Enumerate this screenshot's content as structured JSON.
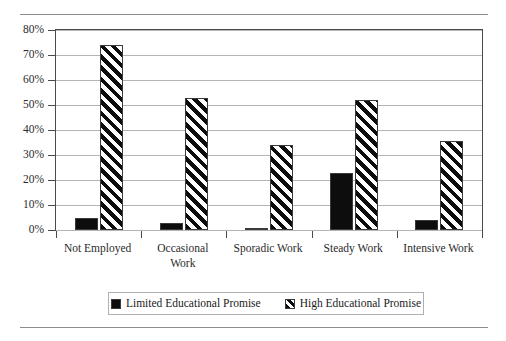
{
  "chart_data": {
    "type": "bar",
    "title": "",
    "subtitle": "",
    "xlabel": "",
    "ylabel": "",
    "ylim": [
      0,
      80
    ],
    "ytick_values": [
      0,
      10,
      20,
      30,
      40,
      50,
      60,
      70,
      80
    ],
    "ytick_labels": [
      "0%",
      "10%",
      "20%",
      "30%",
      "40%",
      "50%",
      "60%",
      "70%",
      "80%"
    ],
    "grid": true,
    "grid_axis": "y",
    "legend_position": "bottom",
    "categories": [
      "Not Employed",
      "Occasional Work",
      "Sporadic Work",
      "Steady Work",
      "Intensive Work"
    ],
    "category_label_lines": [
      [
        "Not Employed"
      ],
      [
        "Occasional",
        "Work"
      ],
      [
        "Sporadic Work"
      ],
      [
        "Steady Work"
      ],
      [
        "Intensive Work"
      ]
    ],
    "series": [
      {
        "name": "Limited Educational Promise",
        "fill": "solid-black",
        "color": "#0d0d0d",
        "values": [
          5,
          3,
          1,
          23,
          4
        ]
      },
      {
        "name": "High Educational Promise",
        "fill": "diagonal-hatch",
        "color": "#0d0d0d",
        "values": [
          74,
          53,
          34,
          52,
          35.5
        ]
      }
    ]
  },
  "legend": {
    "entries": [
      {
        "label": "Limited Educational Promise"
      },
      {
        "label": "High Educational Promise"
      }
    ]
  }
}
